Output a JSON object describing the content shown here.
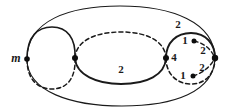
{
  "figure": {
    "background_color": "#ffffff",
    "stroke_color": "#1a1a1a",
    "width": 237,
    "height": 112
  },
  "labels": {
    "m": "m",
    "middle_edge": "2",
    "right_top_outer": "2",
    "right_top_inner": "1",
    "right_left_vertex": "4",
    "right_mid_right": "2",
    "right_bottom_right": "2",
    "right_bottom_inner": "1"
  },
  "vertices": [
    {
      "name": "left-vertex",
      "cx": 27,
      "cy": 59
    },
    {
      "name": "center-vertex",
      "cx": 75,
      "cy": 58
    },
    {
      "name": "right-chain-vertex",
      "cx": 166,
      "cy": 58
    },
    {
      "name": "far-right-vertex",
      "cx": 215,
      "cy": 58
    },
    {
      "name": "upper-inner-dot",
      "cx": 194,
      "cy": 41
    },
    {
      "name": "lower-inner-dot",
      "cx": 193,
      "cy": 76
    }
  ],
  "curves": [
    {
      "name": "outer-ellipse-top",
      "style": "solid"
    },
    {
      "name": "outer-ellipse-bottom",
      "style": "solid"
    },
    {
      "name": "left-circle-top",
      "style": "solid"
    },
    {
      "name": "left-circle-bottom",
      "style": "dashed"
    },
    {
      "name": "middle-ellipse-top",
      "style": "dashed"
    },
    {
      "name": "middle-ellipse-bottom",
      "style": "solid"
    },
    {
      "name": "right-circle-top",
      "style": "solid"
    },
    {
      "name": "right-circle-bottom",
      "style": "dashed"
    },
    {
      "name": "right-inner-arc-upper",
      "style": "dashed"
    },
    {
      "name": "right-inner-arc-lower",
      "style": "dashed"
    }
  ]
}
